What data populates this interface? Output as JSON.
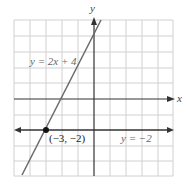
{
  "diagram": {
    "axes": {
      "x_label": "x",
      "y_label": "y"
    },
    "grid": {
      "x_min": -5,
      "x_max": 5,
      "y_min": -5,
      "y_max": 5,
      "spacing": 1
    },
    "lines": [
      {
        "equation": "y = 2x + 4",
        "slope": 2,
        "intercept": 4,
        "color": "#777777"
      },
      {
        "equation": "y = −2",
        "slope": 0,
        "intercept": -2,
        "color": "#333333"
      }
    ],
    "intersection": {
      "label": "(−3, −2)",
      "x": -3,
      "y": -2
    },
    "colors": {
      "grid": "#d0d0d0",
      "axis": "#333333"
    }
  }
}
